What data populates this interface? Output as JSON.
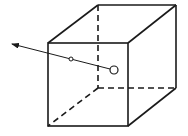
{
  "diagram": {
    "type": "cube-with-ray",
    "stroke_color": "#1a1a1a",
    "background": "#ffffff",
    "cube": {
      "front_face": {
        "x1": 48,
        "y1": 43,
        "x2": 128,
        "y2": 126
      },
      "back_face": {
        "x1": 98,
        "y1": 5,
        "x2": 176,
        "y2": 88
      },
      "hidden_edges": "dashed"
    },
    "ray": {
      "start": {
        "x": 114,
        "y": 70
      },
      "end": {
        "x": 12,
        "y": 44
      },
      "has_arrowhead": true
    },
    "points": [
      {
        "name": "source-point",
        "x": 114,
        "y": 70,
        "r": 4
      },
      {
        "name": "intersection-point",
        "x": 71,
        "y": 59,
        "r": 2
      }
    ]
  }
}
